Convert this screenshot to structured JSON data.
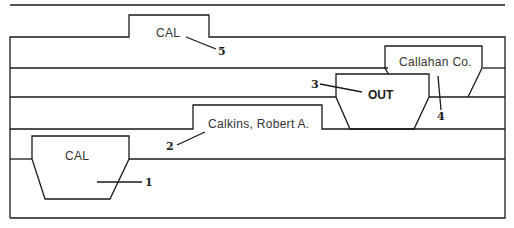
{
  "diagram": {
    "tabs": [
      {
        "id": "guide-top",
        "label": "CAL",
        "callout": "5",
        "style": "guide"
      },
      {
        "id": "folder-callahan",
        "label": "Callahan Co.",
        "callout": "4",
        "style": "folder"
      },
      {
        "id": "out-guide",
        "label": "OUT",
        "callout": "3",
        "style": "out-guide"
      },
      {
        "id": "folder-calkins",
        "label": "Calkins, Robert A.",
        "callout": "2",
        "style": "folder"
      },
      {
        "id": "guide-bottom",
        "label": "CAL",
        "callout": "1",
        "style": "guide"
      }
    ]
  },
  "colors": {
    "line": "#1a1a1a",
    "text": "#333333",
    "background": "#ffffff"
  }
}
